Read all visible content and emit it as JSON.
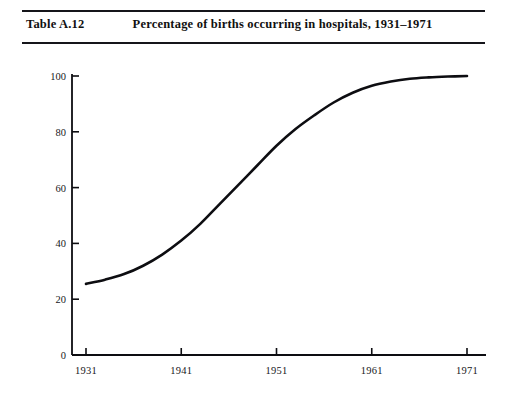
{
  "header": {
    "table_number": "Table A.12",
    "caption": "Percentage of births occurring in hospitals, 1931–1971"
  },
  "chart_data": {
    "type": "line",
    "title": "Percentage of births occurring in hospitals, 1931–1971",
    "xlabel": "",
    "ylabel": "",
    "xlim": [
      1931,
      1971
    ],
    "ylim": [
      0,
      100
    ],
    "grid": false,
    "legend": null,
    "x_ticks": [
      "1931",
      "1941",
      "1951",
      "1961",
      "1971"
    ],
    "x_tick_values": [
      1931,
      1941,
      1951,
      1961,
      1971
    ],
    "y_ticks": [
      "0",
      "20",
      "40",
      "60",
      "80",
      "100"
    ],
    "y_tick_values": [
      0,
      20,
      40,
      60,
      80,
      100
    ],
    "series": [
      {
        "name": "Births in hospitals (%)",
        "color": "#0d0d11",
        "x": [
          1931,
          1933,
          1935,
          1937,
          1939,
          1941,
          1943,
          1945,
          1947,
          1949,
          1951,
          1953,
          1955,
          1957,
          1959,
          1961,
          1963,
          1965,
          1967,
          1969,
          1971
        ],
        "values": [
          25.5,
          27,
          29,
          32,
          36,
          41,
          47,
          54,
          61,
          68,
          75,
          81,
          86,
          90.5,
          94,
          96.5,
          98,
          99,
          99.5,
          99.8,
          100
        ]
      }
    ]
  },
  "axes_geometry": {
    "x_pixel_left": 86,
    "x_pixel_right": 467,
    "y_pixel_bottom": 355,
    "y_pixel_top": 76,
    "spine_x": 72,
    "spine_right_end": 486
  }
}
